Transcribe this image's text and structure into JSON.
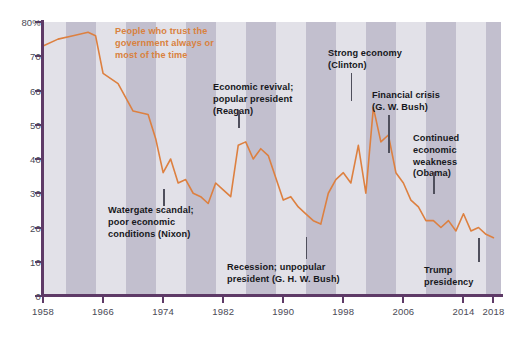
{
  "chart_data": {
    "type": "line",
    "title": "People who trust the government always or most of the time",
    "xlabel": "",
    "ylabel": "",
    "xlim": [
      1958,
      2019
    ],
    "ylim": [
      0,
      80
    ],
    "grid": false,
    "legend": "none",
    "line_color": "#dd8040",
    "axis_color": "#5e3a67",
    "band_color": "#bcb8c9",
    "plot_bg": "#e2e1e8",
    "y_ticks": [
      "0",
      "10",
      "20",
      "30",
      "40",
      "50",
      "60",
      "70",
      "80%"
    ],
    "y_tick_values": [
      0,
      10,
      20,
      30,
      40,
      50,
      60,
      70,
      80
    ],
    "x_ticks": [
      "1958",
      "1966",
      "1974",
      "1982",
      "1990",
      "1998",
      "2006",
      "2014",
      "2018"
    ],
    "x_tick_values": [
      1958,
      1966,
      1974,
      1982,
      1990,
      1998,
      2006,
      2014,
      2018
    ],
    "series": [
      {
        "name": "Trust the government always or most of the time",
        "x": [
          1958,
          1960,
          1962,
          1964,
          1965,
          1966,
          1968,
          1970,
          1972,
          1973,
          1974,
          1975,
          1976,
          1977,
          1978,
          1979,
          1980,
          1981,
          1982,
          1983,
          1984,
          1985,
          1986,
          1987,
          1988,
          1990,
          1991,
          1992,
          1993,
          1994,
          1995,
          1996,
          1997,
          1998,
          1999,
          2000,
          2001,
          2002,
          2003,
          2004,
          2005,
          2006,
          2007,
          2008,
          2009,
          2010,
          2011,
          2012,
          2013,
          2014,
          2015,
          2016,
          2017,
          2018
        ],
        "values": [
          73,
          75,
          76,
          77,
          76,
          65,
          62,
          54,
          53,
          46,
          36,
          40,
          33,
          34,
          30,
          29,
          27,
          33,
          31,
          29,
          44,
          45,
          40,
          43,
          41,
          28,
          29,
          26,
          24,
          22,
          21,
          30,
          34,
          36,
          33,
          44,
          30,
          55,
          45,
          47,
          36,
          33,
          28,
          26,
          22,
          22,
          20,
          22,
          19,
          24,
          19,
          20,
          18,
          17
        ],
        "color": "#dd8040"
      }
    ],
    "annotations": [
      {
        "id": "headline",
        "text": "People who trust the\ngovernment always or\nmost of the time",
        "style": "headline"
      },
      {
        "id": "watergate",
        "text": "Watergate scandal;\npoor economic\nconditions (Nixon)",
        "leader_year": 1974
      },
      {
        "id": "reagan",
        "text": "Economic revival;\npopular president\n(Reagan)",
        "leader_year": 1984
      },
      {
        "id": "ghw-bush",
        "text": "Recession; unpopular\npresident (G. H. W. Bush)",
        "leader_year": 1993
      },
      {
        "id": "clinton",
        "text": "Strong economy\n(Clinton)",
        "leader_year": 1999
      },
      {
        "id": "gw-bush",
        "text": "Financial crisis\n(G. W. Bush)",
        "leader_year": 2004
      },
      {
        "id": "obama",
        "text": "Continued\neconomic\nweakness\n(Obama)",
        "leader_year": 2010
      },
      {
        "id": "trump",
        "text": "Trump\npresidency",
        "leader_year": 2016
      }
    ],
    "bands": [
      {
        "start": 1961,
        "end": 1965
      },
      {
        "start": 1969,
        "end": 1973
      },
      {
        "start": 1977,
        "end": 1981
      },
      {
        "start": 1985,
        "end": 1989
      },
      {
        "start": 1993,
        "end": 1997
      },
      {
        "start": 2001,
        "end": 2005
      },
      {
        "start": 2009,
        "end": 2013
      },
      {
        "start": 2017,
        "end": 2019
      }
    ]
  }
}
